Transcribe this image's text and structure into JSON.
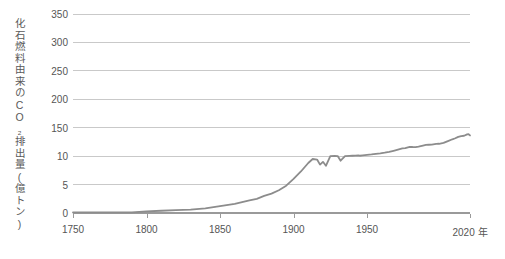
{
  "chart_data": {
    "type": "line",
    "title": "",
    "subtitle": "",
    "xlabel": "",
    "ylabel": "化石燃料由来のCO₂排出量(億トン)",
    "x_unit_suffix": "年",
    "xlim": [
      1750,
      2020
    ],
    "ylim": [
      0,
      380
    ],
    "grid": true,
    "legend": null,
    "x_tick_labels": [
      "1750",
      "1800",
      "1850",
      "1900",
      "1950",
      "2020 年"
    ],
    "x_ticks": [
      1750,
      1800,
      1850,
      1900,
      1950,
      2020
    ],
    "y_tick_labels": [
      "0",
      "5",
      "10",
      "150",
      "200",
      "250",
      "300",
      "350"
    ],
    "y_ticks": [
      0,
      5,
      10,
      150,
      200,
      250,
      300,
      350
    ],
    "series": [
      {
        "name": "化石燃料由来のCO₂排出量",
        "color": "#8c8c8c",
        "x": [
          1750,
          1760,
          1770,
          1780,
          1790,
          1800,
          1810,
          1820,
          1830,
          1840,
          1850,
          1860,
          1870,
          1875,
          1880,
          1885,
          1890,
          1895,
          1900,
          1905,
          1910,
          1913,
          1916,
          1918,
          1920,
          1922,
          1925,
          1928,
          1930,
          1932,
          1935,
          1938,
          1940,
          1942,
          1944,
          1945,
          1947,
          1950,
          1953,
          1956,
          1959,
          1962,
          1965,
          1968,
          1971,
          1974,
          1976,
          1979,
          1981,
          1983,
          1985,
          1988,
          1990,
          1992,
          1994,
          1997,
          1999,
          2002,
          2005,
          2008,
          2010,
          2012,
          2014,
          2016,
          2018,
          2019,
          2020
        ],
        "y": [
          0.1,
          0.1,
          0.1,
          0.1,
          0.1,
          0.3,
          0.4,
          0.5,
          0.6,
          0.8,
          1.2,
          1.6,
          2.2,
          2.5,
          3.0,
          3.4,
          4.0,
          4.8,
          6.0,
          7.3,
          8.8,
          9.5,
          9.4,
          8.5,
          9.0,
          8.3,
          10.0,
          11.0,
          10.5,
          9.2,
          10.0,
          11.2,
          12.0,
          12.8,
          13.5,
          12.0,
          13.8,
          16.0,
          18.5,
          21.5,
          24.0,
          27.0,
          31.5,
          36.5,
          42.0,
          48.0,
          49.5,
          56.0,
          55.0,
          54.5,
          57.0,
          62.0,
          65.0,
          66.0,
          66.5,
          70.0,
          71.0,
          75.0,
          84.0,
          93.0,
          98.0,
          105.0,
          109.0,
          110.5,
          117.0,
          118.0,
          112.0
        ],
        "note_axis": "Y scale as printed: ticks 0,5,10,150,200,250,300,350 at equal spacing"
      }
    ]
  },
  "axis": {
    "y_title": "化石燃料由来のCO₂排出量(億トン)",
    "x_unit": "年"
  },
  "colors": {
    "line": "#8c8c8c",
    "grid": "#c9c9c9",
    "axis": "#9a9a9a",
    "text": "#555555",
    "background": "#ffffff"
  }
}
